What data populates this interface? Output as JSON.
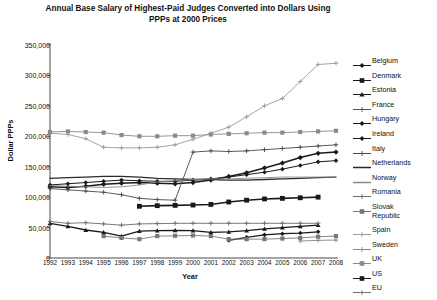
{
  "chart_data": {
    "type": "line",
    "title": "Annual Base Salary of Highest-Paid Judges Converted into Dollars Using PPPs at 2000 Prices",
    "xlabel": "Year",
    "ylabel": "Dollar PPPs",
    "x": [
      1992,
      1993,
      1994,
      1995,
      1996,
      1997,
      1998,
      1999,
      2000,
      2001,
      2002,
      2003,
      2004,
      2005,
      2006,
      2007,
      2008
    ],
    "xtick_labels": [
      "1992",
      "1993",
      "1994",
      "1995",
      "1996",
      "1997",
      "1998",
      "1999",
      "2000",
      "2001",
      "2002",
      "2003",
      "2004",
      "2005",
      "2006",
      "2007",
      "2008"
    ],
    "ytick_labels": [
      "0",
      "50,000",
      "100,000",
      "150,000",
      "200,000",
      "250,000",
      "300,000",
      "350,000"
    ],
    "ytick_values": [
      0,
      50000,
      100000,
      150000,
      200000,
      250000,
      300000,
      350000
    ],
    "ylim": [
      0,
      350000
    ],
    "xlim": [
      1992,
      2008
    ],
    "grid": false,
    "legend_position": "right",
    "series": [
      {
        "name": "Belgium",
        "marker": "diamond",
        "color": "#1a1a1a",
        "weight": 1.0,
        "values": [
          120000,
          122000,
          124000,
          126000,
          128000,
          127000,
          126000,
          126000,
          128000,
          130000,
          133000,
          137000,
          141000,
          146000,
          152000,
          158000,
          160000
        ]
      },
      {
        "name": "Denmark",
        "marker": "square",
        "color": "#1a1a1a",
        "weight": 1.6,
        "values": [
          null,
          null,
          null,
          null,
          null,
          85000,
          86000,
          86500,
          87000,
          88000,
          92000,
          95000,
          97000,
          98000,
          99000,
          100000,
          null
        ]
      },
      {
        "name": "Estonia",
        "marker": "triangle",
        "color": "#1a1a1a",
        "weight": 1.3,
        "values": [
          57000,
          52000,
          46000,
          42000,
          36000,
          44000,
          45000,
          45500,
          45000,
          42000,
          43000,
          45000,
          48000,
          50000,
          52000,
          54000,
          null
        ]
      },
      {
        "name": "France",
        "marker": "plus",
        "color": "#555555",
        "weight": 0.9,
        "values": [
          null,
          null,
          null,
          null,
          null,
          null,
          null,
          null,
          null,
          null,
          null,
          null,
          null,
          null,
          null,
          null,
          null
        ]
      },
      {
        "name": "Hungary",
        "marker": "diamond",
        "color": "#1a1a1a",
        "weight": 1.2,
        "values": [
          null,
          null,
          null,
          null,
          null,
          null,
          null,
          null,
          null,
          null,
          29000,
          34000,
          38000,
          40000,
          41000,
          43000,
          null
        ]
      },
      {
        "name": "Ireland",
        "marker": "diamond",
        "color": "#1a1a1a",
        "weight": 1.5,
        "values": [
          117000,
          116000,
          118000,
          121000,
          123000,
          124000,
          123000,
          122000,
          124000,
          128000,
          134000,
          140000,
          148000,
          156000,
          165000,
          172000,
          174000
        ]
      },
      {
        "name": "Italy",
        "marker": "plus",
        "color": "#4a4a4a",
        "weight": 0.9,
        "values": [
          114000,
          112000,
          110000,
          108000,
          104000,
          98000,
          96000,
          95000,
          174000,
          176000,
          175000,
          176000,
          178000,
          180000,
          182000,
          184000,
          186000
        ]
      },
      {
        "name": "Netherlands",
        "marker": "none",
        "color": "#2a2a2a",
        "weight": 1.3,
        "values": [
          131000,
          132000,
          133000,
          134000,
          134000,
          133000,
          131000,
          130000,
          129000,
          129000,
          128000,
          128000,
          129000,
          130000,
          131000,
          132000,
          133000
        ]
      },
      {
        "name": "Norway",
        "marker": "none",
        "color": "#8a8a8a",
        "weight": 0.9,
        "values": [
          119000,
          118000,
          117000,
          116000,
          117000,
          120000,
          125000,
          127000,
          129000,
          130000,
          130000,
          131000,
          132000,
          133000,
          133000,
          133000,
          133000
        ]
      },
      {
        "name": "Romania",
        "marker": "plus",
        "color": "#6a6a6a",
        "weight": 0.9,
        "values": [
          60000,
          57000,
          58000,
          56000,
          54000,
          56000,
          56500,
          57000,
          57000,
          57000,
          57000,
          57000,
          57000,
          57000,
          57000,
          57000,
          null
        ]
      },
      {
        "name": "Slovak Republic",
        "marker": "square",
        "color": "#777777",
        "weight": 0.9,
        "values": [
          null,
          null,
          null,
          36000,
          33000,
          31000,
          36000,
          36500,
          37000,
          36000,
          31000,
          31000,
          31000,
          32000,
          33000,
          35000,
          36000
        ]
      },
      {
        "name": "Spain",
        "marker": "plus",
        "color": "#9a9a9a",
        "weight": 0.9,
        "values": [
          205000,
          203000,
          196000,
          182000,
          181000,
          181000,
          182000,
          186000,
          195000,
          205000,
          215000,
          232000,
          250000,
          262000,
          290000,
          318000,
          320000
        ]
      },
      {
        "name": "Sweden",
        "marker": "plus",
        "color": "#888888",
        "weight": 0.9,
        "values": [
          null,
          null,
          null,
          null,
          null,
          null,
          null,
          null,
          null,
          null,
          null,
          null,
          null,
          null,
          28000,
          29000,
          29500
        ]
      },
      {
        "name": "UK",
        "marker": "square",
        "color": "#8a8a8a",
        "weight": 0.9,
        "values": [
          207000,
          208000,
          207000,
          206000,
          202000,
          200000,
          200000,
          201000,
          201000,
          203000,
          204000,
          205000,
          206000,
          206000,
          207000,
          208000,
          209000
        ]
      },
      {
        "name": "US",
        "marker": "square",
        "color": "#1a1a1a",
        "weight": 1.7,
        "values": [
          null,
          null,
          null,
          null,
          null,
          null,
          null,
          null,
          null,
          null,
          null,
          null,
          null,
          null,
          null,
          null,
          null
        ]
      },
      {
        "name": "EU",
        "marker": "plus",
        "color": "#707070",
        "weight": 0.9,
        "values": [
          null,
          null,
          null,
          null,
          null,
          null,
          null,
          null,
          null,
          null,
          null,
          null,
          null,
          null,
          null,
          null,
          null
        ]
      }
    ]
  },
  "legend": {
    "items": [
      {
        "label": "Belgium",
        "marker": "diamond",
        "color": "#1a1a1a"
      },
      {
        "label": "Denmark",
        "marker": "square",
        "color": "#1a1a1a"
      },
      {
        "label": "Estonia",
        "marker": "triangle",
        "color": "#1a1a1a"
      },
      {
        "label": "France",
        "marker": "plus",
        "color": "#555555"
      },
      {
        "label": "Hungary",
        "marker": "diamond",
        "color": "#1a1a1a"
      },
      {
        "label": "Ireland",
        "marker": "diamond",
        "color": "#1a1a1a"
      },
      {
        "label": "Italy",
        "marker": "plus",
        "color": "#4a4a4a"
      },
      {
        "label": "Netherlands",
        "marker": "none",
        "color": "#2a2a2a"
      },
      {
        "label": "Norway",
        "marker": "none",
        "color": "#8a8a8a"
      },
      {
        "label": "Romania",
        "marker": "plus",
        "color": "#6a6a6a"
      },
      {
        "label": "Slovak\nRepublic",
        "marker": "square",
        "color": "#777777"
      },
      {
        "label": "Spain",
        "marker": "plus",
        "color": "#9a9a9a"
      },
      {
        "label": "Sweden",
        "marker": "plus",
        "color": "#888888"
      },
      {
        "label": "UK",
        "marker": "square",
        "color": "#8a8a8a"
      },
      {
        "label": "US",
        "marker": "square",
        "color": "#1a1a1a"
      },
      {
        "label": "EU",
        "marker": "plus",
        "color": "#707070"
      }
    ]
  },
  "colors": {
    "axis": "#333333",
    "text": "#111111",
    "background": "#ffffff"
  }
}
